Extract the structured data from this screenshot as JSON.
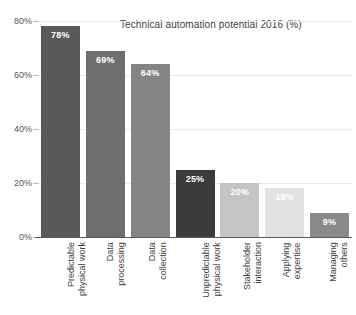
{
  "chart_data": {
    "type": "bar",
    "title": "Technical automation potential 2016 (%)",
    "xlabel": "",
    "ylabel": "",
    "ylim": [
      0,
      80
    ],
    "grid": true,
    "legend": "none",
    "categories": [
      "Predictable physical work",
      "Data processing",
      "Data collection",
      "Unpredictable physical work",
      "Stakeholder interaction",
      "Applying expertise",
      "Managing others"
    ],
    "category_lines": [
      [
        "Predictable",
        "physical work"
      ],
      [
        "Data",
        "processing"
      ],
      [
        "Data",
        "collection"
      ],
      [
        "Unpredictable",
        "physical work"
      ],
      [
        "Stakeholder",
        "interaction"
      ],
      [
        "Applying",
        "expertise"
      ],
      [
        "Managing",
        "others"
      ]
    ],
    "values": [
      78,
      69,
      64,
      25,
      20,
      18,
      9
    ],
    "value_labels": [
      "78%",
      "69%",
      "64%",
      "25%",
      "20%",
      "18%",
      "9%"
    ],
    "bar_colors": [
      "#595959",
      "#6e6e6e",
      "#848484",
      "#3b3b3b",
      "#c5c5c5",
      "#e2e2e2",
      "#8a8a8a"
    ],
    "y_ticks": [
      0,
      20,
      40,
      60,
      80
    ],
    "y_tick_labels": [
      "0%",
      "20%",
      "40%",
      "60%",
      "80%"
    ]
  },
  "chart": {
    "title": "Technical automation potential 2016 (%)",
    "background_color": "#ffffff",
    "gridline_color": "#eaeaea",
    "axis_color": "#5a5a5a",
    "label_color": "#3f3f3f",
    "value_label_color": "#ffffff"
  }
}
